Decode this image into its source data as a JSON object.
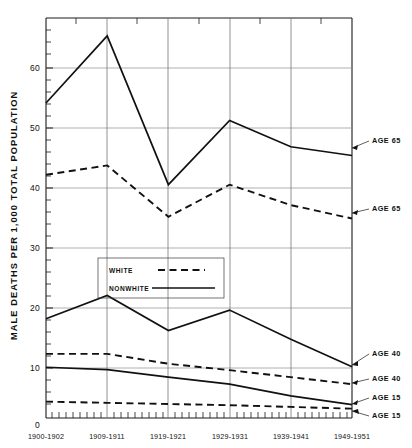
{
  "chart_data": {
    "type": "line",
    "title": "",
    "subtitle": "",
    "xlabel": "",
    "ylabel": "MALE DEATHS PER 1,000 TOTAL POPULATION",
    "categories": [
      "1900-1902",
      "1909-1911",
      "1919-1921",
      "1929-1931",
      "1939-1941",
      "1949-1951"
    ],
    "x": [
      0,
      1,
      2,
      3,
      4,
      5
    ],
    "ylim": [
      0,
      68
    ],
    "xlim": [
      0,
      5
    ],
    "yticks": [
      0,
      10,
      20,
      30,
      40,
      50,
      60
    ],
    "ytick_labels": [
      "0",
      "10",
      "20",
      "30",
      "40",
      "50",
      "60"
    ],
    "grid": true,
    "grid_axis": "both",
    "legend_position": "center-left",
    "legend": [
      {
        "name": "WHITE",
        "style": "dashed"
      },
      {
        "name": "NONWHITE",
        "style": "solid"
      }
    ],
    "series": [
      {
        "name": "NONWHITE AGE 65",
        "group": "NONWHITE",
        "style": "solid",
        "label": "AGE 65",
        "values": [
          54.0,
          65.5,
          40.0,
          51.0,
          46.5,
          45.0
        ]
      },
      {
        "name": "WHITE AGE 65",
        "group": "WHITE",
        "style": "dashed",
        "label": "AGE 65",
        "values": [
          41.7,
          43.3,
          34.5,
          40.0,
          36.5,
          34.2
        ]
      },
      {
        "name": "NONWHITE AGE 40",
        "group": "NONWHITE",
        "style": "solid",
        "label": "AGE 40",
        "values": [
          17.0,
          21.0,
          15.0,
          18.5,
          13.5,
          8.8
        ]
      },
      {
        "name": "WHITE AGE 40",
        "group": "WHITE",
        "style": "dashed",
        "label": "AGE 40",
        "values": [
          11.0,
          11.0,
          9.3,
          8.2,
          7.0,
          5.8
        ]
      },
      {
        "name": "NONWHITE AGE 15",
        "group": "NONWHITE",
        "style": "solid",
        "label": "AGE 15",
        "values": [
          8.7,
          8.3,
          7.0,
          5.8,
          3.8,
          2.3
        ]
      },
      {
        "name": "WHITE AGE 15",
        "group": "WHITE",
        "style": "dashed",
        "label": "AGE 15",
        "values": [
          2.8,
          2.6,
          2.4,
          2.2,
          1.9,
          1.6
        ]
      }
    ],
    "annotations": [
      {
        "text": "AGE 65",
        "series": "NONWHITE AGE 65"
      },
      {
        "text": "AGE 65",
        "series": "WHITE AGE 65"
      },
      {
        "text": "AGE 40",
        "series": "NONWHITE AGE 40"
      },
      {
        "text": "AGE 40",
        "series": "WHITE AGE 40"
      },
      {
        "text": "AGE 15",
        "series": "NONWHITE AGE 15"
      },
      {
        "text": "AGE 15",
        "series": "WHITE AGE 15"
      }
    ]
  },
  "axes": {
    "y_title": "MALE DEATHS PER 1,000 TOTAL POPULATION",
    "y_ticks": [
      "60",
      "50",
      "40",
      "30",
      "20",
      "10",
      "0"
    ],
    "x_ticks": [
      "1900-1902",
      "1909-1911",
      "1919-1921",
      "1929-1931",
      "1939-1941",
      "1949-1951"
    ]
  },
  "legend": {
    "white_label": "WHITE",
    "nonwhite_label": "NONWHITE"
  },
  "annotations": {
    "a1": "AGE 65",
    "a2": "AGE 65",
    "a3": "AGE 40",
    "a4": "AGE 40",
    "a5": "AGE 15",
    "a6": "AGE 15"
  }
}
